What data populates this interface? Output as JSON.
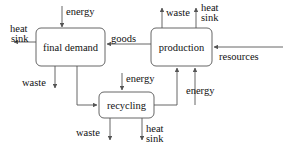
{
  "diagram": {
    "stroke_color": "#555555",
    "text_color": "#111111",
    "nodes": [
      {
        "id": "final_demand",
        "label": "final demand",
        "x": 36,
        "y": 28,
        "w": 69,
        "h": 38
      },
      {
        "id": "production",
        "label": "production",
        "x": 151,
        "y": 28,
        "w": 61,
        "h": 38
      },
      {
        "id": "recycling",
        "label": "recycling",
        "x": 99,
        "y": 92,
        "w": 55,
        "h": 26
      }
    ],
    "flows": [
      {
        "id": "energy-to-final-demand",
        "label": "energy",
        "direction": "down",
        "target": "final_demand"
      },
      {
        "id": "heat-sink-from-final-demand",
        "label": "heat sink",
        "direction": "left",
        "source": "final_demand"
      },
      {
        "id": "goods-to-final-demand",
        "label": "goods",
        "direction": "left",
        "source": "production",
        "target": "final_demand"
      },
      {
        "id": "waste-from-final-demand",
        "label": "waste",
        "direction": "down",
        "source": "final_demand"
      },
      {
        "id": "final-demand-to-recycling",
        "label": "",
        "direction": "right",
        "source": "final_demand",
        "target": "recycling"
      },
      {
        "id": "waste-from-production",
        "label": "waste",
        "direction": "up",
        "source": "production"
      },
      {
        "id": "heat-sink-from-production",
        "label": "heat sink",
        "direction": "up",
        "source": "production"
      },
      {
        "id": "resources-to-production",
        "label": "resources",
        "direction": "left",
        "target": "production"
      },
      {
        "id": "energy-to-production",
        "label": "energy",
        "direction": "up",
        "target": "production"
      },
      {
        "id": "recycling-to-production",
        "label": "",
        "direction": "up",
        "source": "recycling",
        "target": "production"
      },
      {
        "id": "energy-to-recycling",
        "label": "energy",
        "direction": "down",
        "target": "recycling"
      },
      {
        "id": "waste-from-recycling",
        "label": "waste",
        "direction": "down",
        "source": "recycling"
      },
      {
        "id": "heat-sink-from-recycling",
        "label": "heat sink",
        "direction": "down",
        "source": "recycling"
      }
    ],
    "labels": {
      "final_demand": "final demand",
      "production": "production",
      "recycling": "recycling",
      "energy_top_left": "energy",
      "heat_sink_left": "heat\nsink",
      "heat_sink_left_line1": "heat",
      "heat_sink_left_line2": "sink",
      "goods": "goods",
      "waste_final_demand": "waste",
      "waste_production": "waste",
      "heat_sink_production_line1": "heat",
      "heat_sink_production_line2": "sink",
      "resources": "resources",
      "energy_recycling": "energy",
      "energy_production": "energy",
      "waste_recycling": "waste",
      "heat_sink_recycling_line1": "heat",
      "heat_sink_recycling_line2": "sink"
    }
  }
}
